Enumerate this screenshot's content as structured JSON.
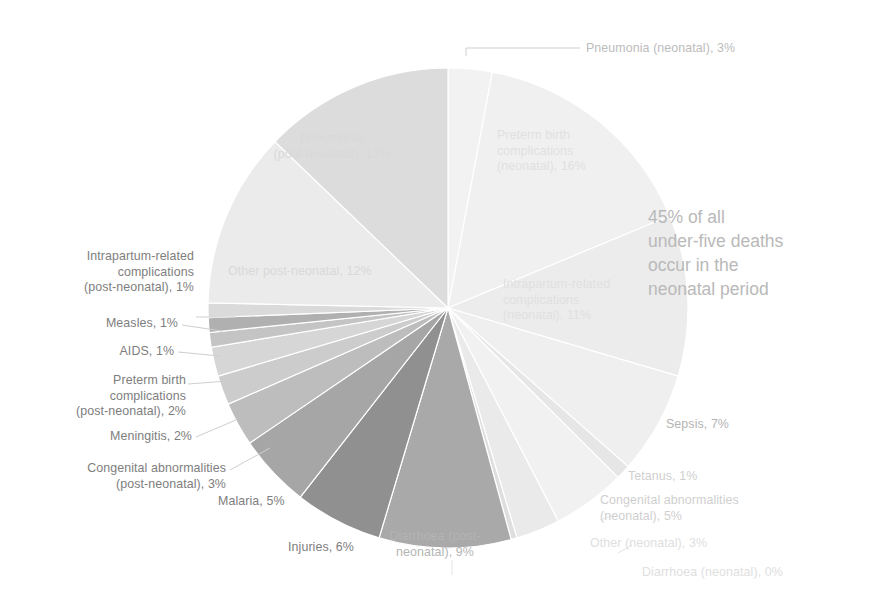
{
  "annotation": {
    "text": "45% of all\nunder-five deaths\noccur in the\nneonatal period"
  },
  "chart_data": {
    "type": "pie",
    "title": "",
    "subtitle": "",
    "xlabel": "",
    "ylabel": "",
    "units": "percent",
    "legend_position": "none",
    "grid": false,
    "total": 100,
    "start_angle_deg": 0,
    "direction": "clockwise",
    "center": {
      "x": 448,
      "y": 308
    },
    "radius": 240,
    "annotations": [
      "45% of all under-five deaths occur in the neonatal period"
    ],
    "categories": [
      "Pneumonia (neonatal)",
      "Preterm birth complications (neonatal)",
      "Intrapartum-related complications (neonatal)",
      "Sepsis",
      "Tetanus",
      "Congenital abnormalities (neonatal)",
      "Other (neonatal)",
      "Diarrhoea (neonatal)",
      "Diarrhoea (post-neonatal)",
      "Injuries",
      "Malaria",
      "Congenital abnormalities (post-neonatal)",
      "Meningitis",
      "Preterm birth complications (post-neonatal)",
      "AIDS",
      "Measles",
      "Intrapartum-related complications (post-neonatal)",
      "Other post-neonatal",
      "Pneumonia (post-neonatal)"
    ],
    "values": [
      3,
      16,
      11,
      7,
      1,
      5,
      3,
      0.4,
      9,
      6,
      5,
      3,
      2,
      2,
      1,
      1,
      1,
      12,
      13
    ],
    "colors": [
      "#f2f2f2",
      "#f0f0f0",
      "#ececec",
      "#efefef",
      "#e6e6e6",
      "#f1f1f1",
      "#eaeaea",
      "#dedede",
      "#a9a9a9",
      "#909090",
      "#a6a6a6",
      "#bdbdbd",
      "#cccccc",
      "#d6d6d6",
      "#c4c4c4",
      "#b0b0b0",
      "#dadada",
      "#ebebeb",
      "#dcdcdc"
    ],
    "labels": [
      {
        "key": "pneumonia-neonatal",
        "text": "Pneumonia (neonatal), 3%",
        "placement": "outside"
      },
      {
        "key": "preterm-neonatal",
        "text": "Preterm birth\ncomplications\n(neonatal), 16%",
        "placement": "inside"
      },
      {
        "key": "intrapartum-neonatal",
        "text": "Intrapartum-related\ncomplications\n(neonatal), 11%",
        "placement": "inside"
      },
      {
        "key": "sepsis",
        "text": "Sepsis, 7%",
        "placement": "outside"
      },
      {
        "key": "tetanus",
        "text": "Tetanus, 1%",
        "placement": "outside"
      },
      {
        "key": "congenital-neonatal",
        "text": "Congenital abnormalities\n(neonatal), 5%",
        "placement": "outside"
      },
      {
        "key": "other-neonatal",
        "text": "Other (neonatal), 3%",
        "placement": "outside"
      },
      {
        "key": "diarrhoea-neonatal",
        "text": "Diarrhoea (neonatal), 0%",
        "placement": "outside"
      },
      {
        "key": "diarrhoea-post-neonatal",
        "text": "Diarrhoea (post-\nneonatal), 9%",
        "placement": "inside"
      },
      {
        "key": "injuries",
        "text": "Injuries, 6%",
        "placement": "outside"
      },
      {
        "key": "malaria",
        "text": "Malaria, 5%",
        "placement": "outside"
      },
      {
        "key": "congenital-post-neonatal",
        "text": "Congenital abnormalities\n(post-neonatal), 3%",
        "placement": "outside"
      },
      {
        "key": "meningitis",
        "text": "Meningitis, 2%",
        "placement": "outside"
      },
      {
        "key": "preterm-post-neonatal",
        "text": "Preterm birth\ncomplications\n(post-neonatal), 2%",
        "placement": "outside"
      },
      {
        "key": "aids",
        "text": "AIDS, 1%",
        "placement": "outside"
      },
      {
        "key": "measles",
        "text": "Measles, 1%",
        "placement": "outside"
      },
      {
        "key": "intrapartum-post-neonatal",
        "text": "Intrapartum-related\ncomplications\n(post-neonatal), 1%",
        "placement": "outside"
      },
      {
        "key": "other-post-neonatal",
        "text": "Other post-neonatal, 12%",
        "placement": "inside"
      },
      {
        "key": "pneumonia-post-neonatal",
        "text": "Pneumonia\n(post-neonatal), 13%",
        "placement": "inside"
      }
    ]
  }
}
